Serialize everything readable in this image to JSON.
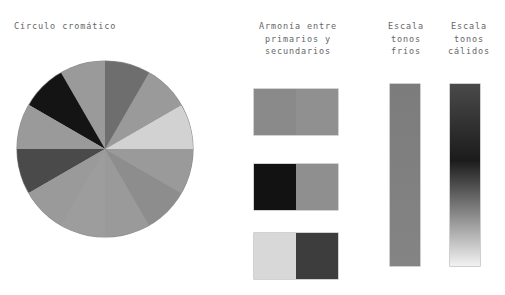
{
  "page": {
    "background": "#ffffff",
    "text_color": "#666666"
  },
  "labels": {
    "circulo": "Círculo cromático",
    "armonia": "Armonía entre\nprimarios y\nsecundarios",
    "frios": "Escala\ntonos\nfríos",
    "calidos": "Escala\ntonos\ncálidos"
  },
  "color_wheel": {
    "segment_count": 6,
    "segment_angle_deg": 60,
    "diameter_px": 176,
    "segments": [
      {
        "name": "segment-top",
        "start_deg": -90,
        "color": "#6e6e6e"
      },
      {
        "name": "segment-top-right",
        "start_deg": -30,
        "color": "#d2d2d2"
      },
      {
        "name": "segment-bottom-right",
        "start_deg": 30,
        "color": "#8d8d8d"
      },
      {
        "name": "segment-bottom",
        "start_deg": 90,
        "color": "#9d9d9d"
      },
      {
        "name": "segment-bottom-left",
        "start_deg": 150,
        "color": "#4a4a4a"
      },
      {
        "name": "segment-top-left",
        "start_deg": 210,
        "color": "#141414"
      }
    ]
  },
  "harmony": {
    "pairs": [
      {
        "name": "pair-1",
        "left_color": "#8a8a8a",
        "right_color": "#909090"
      },
      {
        "name": "pair-2",
        "left_color": "#121212",
        "right_color": "#8f8f8f"
      },
      {
        "name": "pair-3",
        "left_color": "#d8d8d8",
        "right_color": "#3d3d3d"
      }
    ]
  },
  "scales": {
    "cool": {
      "name": "scale-cool",
      "top_color": "#7c7c7c",
      "bottom_color": "#848484"
    },
    "warm": {
      "name": "scale-warm",
      "top_color": "#4a4a4a",
      "mid_color": "#1b1b1b",
      "bottom_color": "#f2f2f2"
    }
  }
}
